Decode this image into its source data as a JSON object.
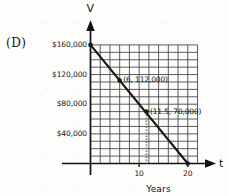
{
  "figure": {
    "option_label": "(D)",
    "y_axis_name": "V",
    "x_axis_name": "t",
    "x_axis_title": "Years"
  },
  "chart_data": {
    "type": "line",
    "title": "",
    "xlabel": "Years",
    "ylabel": "V",
    "xlim": [
      0,
      22
    ],
    "ylim": [
      0,
      170000
    ],
    "grid": true,
    "legend_position": "none",
    "x_ticks": [
      10,
      20
    ],
    "x_tick_labels": [
      "10",
      "20"
    ],
    "y_ticks": [
      40000,
      80000,
      120000,
      160000
    ],
    "y_tick_labels": [
      "$40,000",
      "$80,000",
      "$120,000",
      "$160,000"
    ],
    "grid_x_step": 2,
    "grid_y_step": 10000,
    "grid_x_lines": [
      0,
      2,
      4,
      6,
      8,
      10,
      12,
      14,
      16,
      18,
      20,
      22
    ],
    "grid_y_lines": [
      0,
      10000,
      20000,
      30000,
      40000,
      50000,
      60000,
      70000,
      80000,
      90000,
      100000,
      110000,
      120000,
      130000,
      140000,
      150000,
      160000
    ],
    "series": [
      {
        "name": "Value of asset",
        "x": [
          0,
          20
        ],
        "y": [
          160000,
          0
        ],
        "slope": -8000,
        "intercept": 160000
      }
    ],
    "points": [
      {
        "x": 0,
        "y": 160000,
        "label": "",
        "marked": true
      },
      {
        "x": 6,
        "y": 112000,
        "label": "(6, 112,000)",
        "marked": true
      },
      {
        "x": 11.5,
        "y": 70000,
        "label": "(11.5, 70,000)",
        "marked": true
      },
      {
        "x": 20,
        "y": 0,
        "label": "",
        "marked": true
      }
    ],
    "annotations": [
      {
        "text": "(6, 112,000)",
        "x": 6,
        "y": 112000
      },
      {
        "text": "(11.5, 70,000)",
        "x": 11.5,
        "y": 70000
      }
    ],
    "dropline_x": 11.5,
    "colors": {
      "line": "#171717",
      "grid": "#4a4a4a",
      "axis": "#111111",
      "text": "#141414",
      "background": "#fdfdfb"
    }
  }
}
